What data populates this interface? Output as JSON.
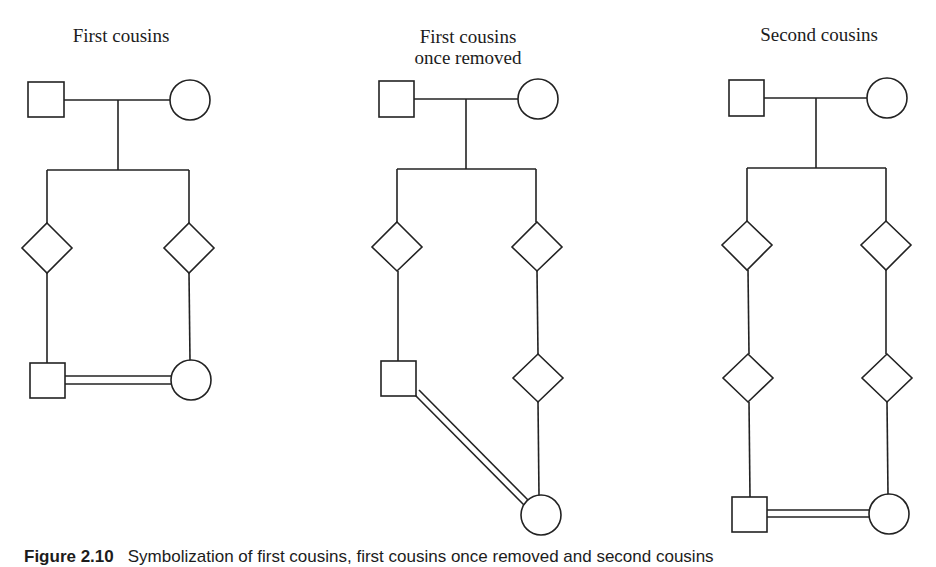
{
  "figure": {
    "caption_label": "Figure 2.10",
    "caption_text": "Symbolization of first cousins, first cousins once removed and second cousins",
    "stroke_color": "#222222",
    "background_color": "#ffffff"
  },
  "panels": [
    {
      "title_line1": "First cousins",
      "title_line2": "",
      "description": "Couple (male square, female circle) with two children of unspecified sex (diamonds); each child's offspring (male square, female circle) joined by a consanguineous double marriage line."
    },
    {
      "title_line1": "First cousins",
      "title_line2": "once removed",
      "description": "Couple with two children (diamonds); left branch has a male grandchild (square); right branch has a grandchild (diamond) then a female great-grandchild (circle); the square and circle joined by a diagonal double line."
    },
    {
      "title_line1": "Second cousins",
      "title_line2": "",
      "description": "Couple with two children (diamonds), each with a child (diamond); left great-grandchild male (square) and right great-grandchild female (circle) joined by a double line."
    }
  ],
  "legend_symbols": {
    "square": "male",
    "circle": "female",
    "diamond": "sex unspecified",
    "double_line": "consanguineous mating"
  }
}
